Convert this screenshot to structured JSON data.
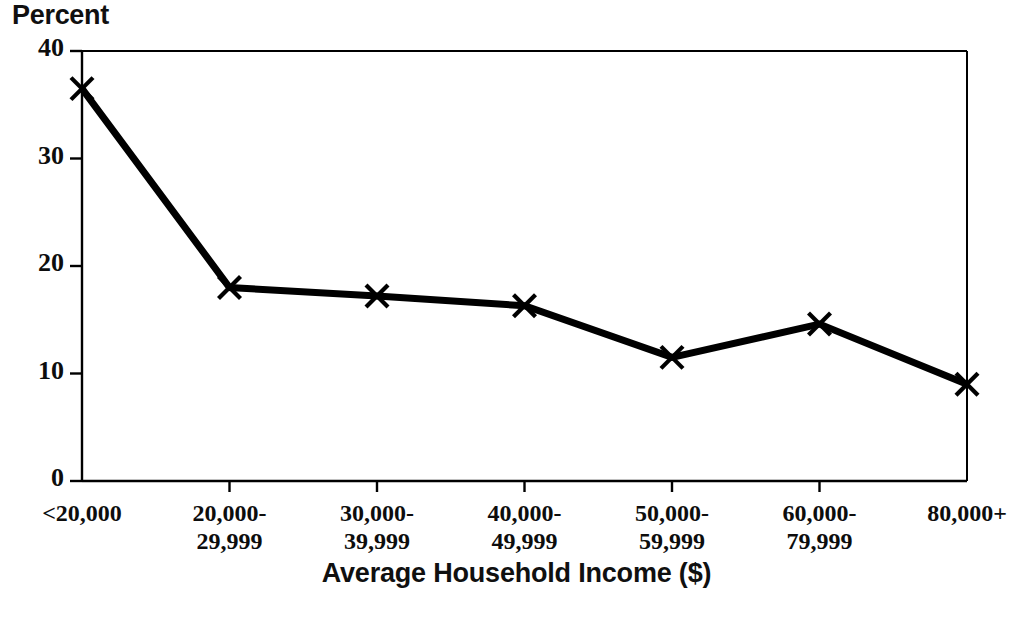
{
  "chart_data": {
    "type": "line",
    "title": "",
    "ylabel": "Percent",
    "xlabel": "Average Household Income ($)",
    "categories": [
      "<20,000",
      "20,000-\n29,999",
      "30,000-\n39,999",
      "40,000-\n49,999",
      "50,000-\n59,999",
      "60,000-\n79,999",
      "80,000+"
    ],
    "category_lines": [
      [
        "<20,000",
        ""
      ],
      [
        "20,000-",
        "29,999"
      ],
      [
        "30,000-",
        "39,999"
      ],
      [
        "40,000-",
        "49,999"
      ],
      [
        "50,000-",
        "59,999"
      ],
      [
        "60,000-",
        "79,999"
      ],
      [
        "80,000+",
        ""
      ]
    ],
    "values": [
      36.5,
      18.0,
      17.2,
      16.3,
      11.5,
      14.6,
      9.0
    ],
    "ylim": [
      0,
      40
    ],
    "yticks": [
      0,
      10,
      20,
      30,
      40
    ],
    "ytick_labels": [
      "0",
      "10",
      "20",
      "30",
      "40"
    ],
    "grid": false,
    "legend": "none",
    "marker": "x",
    "line_color": "#000000",
    "marker_color": "#000000",
    "axis_color": "#000000",
    "background": "#ffffff"
  },
  "axes": {
    "y_title": "Percent",
    "x_title": "Average Household Income ($)"
  },
  "artifact": {
    "footer_text": ""
  }
}
